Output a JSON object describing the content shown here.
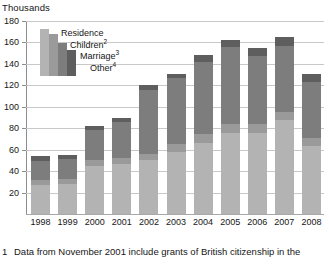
{
  "unit_label": "Thousands",
  "footnote": {
    "number": "1",
    "text": "Data from November 2001 include grants of British citizenship in the"
  },
  "legend": {
    "items": [
      {
        "label": "Residence",
        "sup": "",
        "color": "#b3b3b3"
      },
      {
        "label": "Children",
        "sup": "2",
        "color": "#9a9a9a"
      },
      {
        "label": "Marriage",
        "sup": "3",
        "color": "#7d7d7d"
      },
      {
        "label": "Other",
        "sup": "4",
        "color": "#5e5e5e"
      }
    ]
  },
  "chart_data": {
    "type": "bar",
    "stacked": true,
    "title": "",
    "subtitle": "",
    "xlabel": "",
    "ylabel": "Thousands",
    "ylim": [
      0,
      180
    ],
    "yticks": [
      0,
      20,
      40,
      60,
      80,
      100,
      120,
      140,
      160,
      180
    ],
    "ytick_labels": [
      "",
      "20",
      "40",
      "60",
      "80",
      "100",
      "120",
      "140",
      "160",
      "180"
    ],
    "grid": true,
    "legend_position": "upper-left-inside",
    "categories": [
      "1998",
      "1999",
      "2000",
      "2001",
      "2002",
      "2003",
      "2004",
      "2005",
      "2006",
      "2007",
      "2008"
    ],
    "series": [
      {
        "name": "Residence",
        "color": "#b3b3b3",
        "values": [
          27,
          28,
          45,
          47,
          50,
          58,
          66,
          76,
          76,
          88,
          63
        ]
      },
      {
        "name": "Children",
        "color": "#9a9a9a",
        "values": [
          5,
          5,
          5,
          5,
          6,
          7,
          9,
          8,
          8,
          7,
          8
        ]
      },
      {
        "name": "Marriage",
        "color": "#7d7d7d",
        "values": [
          17,
          18,
          28,
          34,
          60,
          62,
          67,
          72,
          63,
          62,
          52
        ]
      },
      {
        "name": "Other",
        "color": "#5e5e5e",
        "values": [
          5,
          4,
          4,
          4,
          4,
          4,
          6,
          6,
          8,
          8,
          8
        ]
      }
    ],
    "totals": [
      54,
      55,
      82,
      90,
      120,
      131,
      148,
      162,
      155,
      165,
      131
    ]
  }
}
